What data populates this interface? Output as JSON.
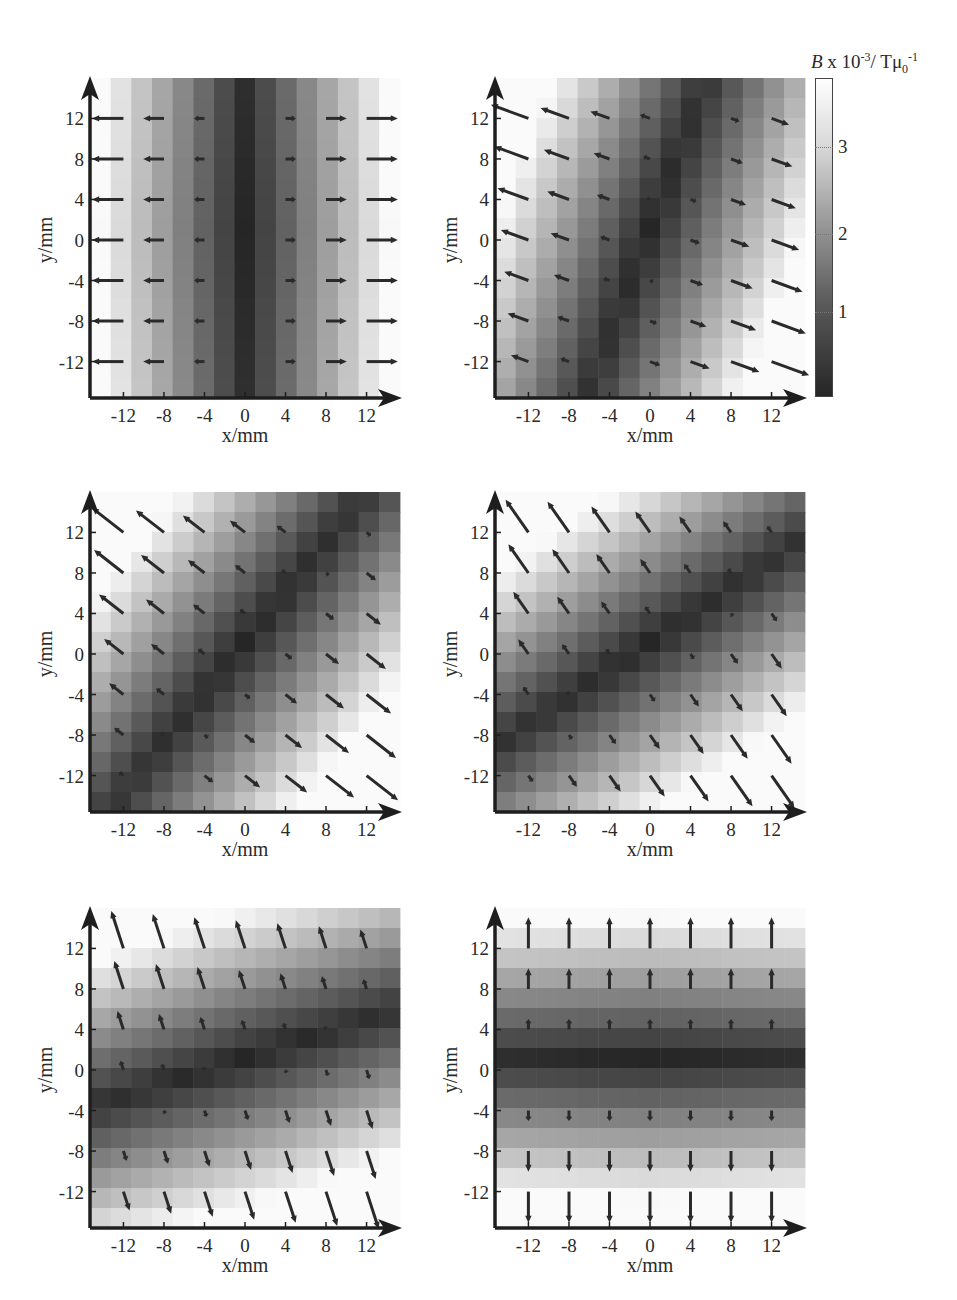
{
  "figure": {
    "colorbar": {
      "title_symbol": "B",
      "title_rest": " x 10",
      "title_exp": "-3",
      "title_unit": "/ Tμ",
      "title_sub": "0",
      "title_sup2": "-1",
      "ticks": [
        "1",
        "2",
        "3"
      ],
      "range": [
        0,
        3.7
      ],
      "colors": {
        "min": "#262626",
        "max": "#ffffff"
      }
    }
  },
  "chart_data": [
    {
      "type": "heatmap",
      "title": "",
      "xlabel": "x/mm",
      "ylabel": "y/mm",
      "xticks": [
        "-12",
        "-8",
        "-4",
        "0",
        "4",
        "8",
        "12"
      ],
      "yticks": [
        "12",
        "8",
        "4",
        "0",
        "-4",
        "-8",
        "-12"
      ],
      "xlim": [
        -15,
        15
      ],
      "ylim": [
        -15,
        15
      ],
      "field_angle_deg": 0,
      "description": "|B| min along x=0 (vertical dark band); arrows horizontal, pointing away from x=0, length grows with |x|",
      "quiver_grid": [
        -12,
        -8,
        -4,
        0,
        4,
        8,
        12
      ]
    },
    {
      "type": "heatmap",
      "title": "",
      "xlabel": "x/mm",
      "ylabel": "y/mm",
      "xticks": [
        "-12",
        "-8",
        "-4",
        "0",
        "4",
        "8",
        "12"
      ],
      "yticks": [
        "12",
        "8",
        "4",
        "0",
        "-4",
        "-8",
        "-12"
      ],
      "xlim": [
        -15,
        15
      ],
      "ylim": [
        -15,
        15
      ],
      "field_angle_deg": -20,
      "description": "dark band slightly tilted from vertical; arrows tilted ~20° below horizontal",
      "quiver_grid": [
        -12,
        -8,
        -4,
        0,
        4,
        8,
        12
      ]
    },
    {
      "type": "heatmap",
      "title": "",
      "xlabel": "x/mm",
      "ylabel": "y/mm",
      "xticks": [
        "-12",
        "-8",
        "-4",
        "0",
        "4",
        "8",
        "12"
      ],
      "yticks": [
        "12",
        "8",
        "4",
        "0",
        "-4",
        "-8",
        "-12"
      ],
      "xlim": [
        -15,
        15
      ],
      "ylim": [
        -15,
        15
      ],
      "field_angle_deg": -38,
      "description": "dark band diagonal lower-left to upper-right; arrows ~38° below horizontal",
      "quiver_grid": [
        -12,
        -8,
        -4,
        0,
        4,
        8,
        12
      ]
    },
    {
      "type": "heatmap",
      "title": "",
      "xlabel": "x/mm",
      "ylabel": "y/mm",
      "xticks": [
        "-12",
        "-8",
        "-4",
        "0",
        "4",
        "8",
        "12"
      ],
      "yticks": [
        "12",
        "8",
        "4",
        "0",
        "-4",
        "-8",
        "-12"
      ],
      "xlim": [
        -15,
        15
      ],
      "ylim": [
        -15,
        15
      ],
      "field_angle_deg": -55,
      "description": "dark band ~35° from horizontal; arrows ~55° below horizontal",
      "quiver_grid": [
        -12,
        -8,
        -4,
        0,
        4,
        8,
        12
      ]
    },
    {
      "type": "heatmap",
      "title": "",
      "xlabel": "x/mm",
      "ylabel": "y/mm",
      "xticks": [
        "-12",
        "-8",
        "-4",
        "0",
        "4",
        "8",
        "12"
      ],
      "yticks": [
        "12",
        "8",
        "4",
        "0",
        "-4",
        "-8",
        "-12"
      ],
      "xlim": [
        -15,
        15
      ],
      "ylim": [
        -15,
        15
      ],
      "field_angle_deg": -72,
      "description": "dark band nearly horizontal slightly tilted; arrows ~72° below horizontal",
      "quiver_grid": [
        -12,
        -8,
        -4,
        0,
        4,
        8,
        12
      ]
    },
    {
      "type": "heatmap",
      "title": "",
      "xlabel": "x/mm",
      "ylabel": "y/mm",
      "xticks": [
        "-12",
        "-8",
        "-4",
        "0",
        "4",
        "8",
        "12"
      ],
      "yticks": [
        "12",
        "8",
        "4",
        "0",
        "-4",
        "-8",
        "-12"
      ],
      "xlim": [
        -15,
        15
      ],
      "ylim": [
        -15,
        15
      ],
      "field_angle_deg": -90,
      "description": "|B| min along y=0 (horizontal dark band); arrows vertical pointing away from y=0",
      "quiver_grid": [
        -12,
        -8,
        -4,
        0,
        4,
        8,
        12
      ]
    }
  ],
  "panels": [
    {
      "left": 90,
      "top": 78,
      "angle": 0,
      "xlabel": "x/mm",
      "ylabel": "y/mm"
    },
    {
      "left": 495,
      "top": 78,
      "angle": -20,
      "xlabel": "x/mm",
      "ylabel": "y/mm"
    },
    {
      "left": 90,
      "top": 492,
      "angle": -38,
      "xlabel": "x/mm",
      "ylabel": "y/mm"
    },
    {
      "left": 495,
      "top": 492,
      "angle": -55,
      "xlabel": "x/mm",
      "ylabel": "y/mm"
    },
    {
      "left": 90,
      "top": 908,
      "angle": -72,
      "xlabel": "x/mm",
      "ylabel": "y/mm"
    },
    {
      "left": 495,
      "top": 908,
      "angle": -90,
      "xlabel": "x/mm",
      "ylabel": "y/mm"
    }
  ],
  "ticks": [
    "-12",
    "-8",
    "-4",
    "0",
    "4",
    "8",
    "12"
  ]
}
